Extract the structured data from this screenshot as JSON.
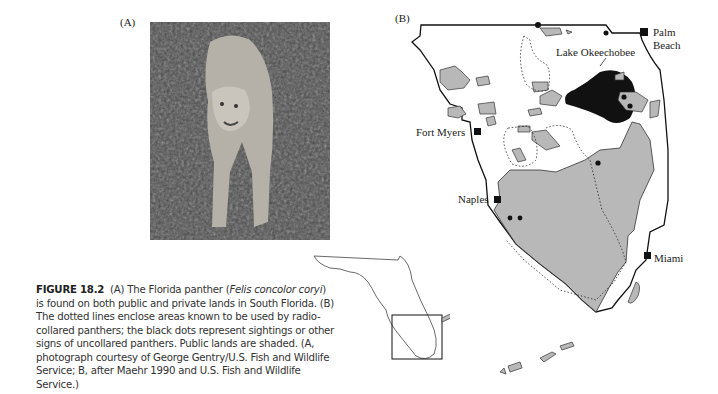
{
  "figure": {
    "number": "FIGURE 18.2",
    "panel_a_label": "(A)",
    "panel_b_label": "(B)",
    "caption": {
      "part1": "(A) The Florida panther (",
      "species": "Felis concolor coryi",
      "part2": ") is found on both public and private lands in South Florida. (B) The dotted lines enclose areas known to be used by radio-collared panthers; the black dots represent sightings or other signs of uncollared panthers. Public lands are shaded. (A, photograph courtesy of George Gentry/U.S. Fish and Wildlife Service; B, after Maehr 1990 and U.S. Fish and Wildlife Service.)"
    }
  },
  "photo": {
    "subject": "Florida panther",
    "tone": "grayscale"
  },
  "map": {
    "lake": "Lake Okeechobee",
    "cities": [
      {
        "name": "Palm",
        "name2": "Beach"
      },
      {
        "name": "Fort Myers"
      },
      {
        "name": "Naples"
      },
      {
        "name": "Miami"
      }
    ],
    "colors": {
      "public_land": "#b8b8b8",
      "lake": "#111111",
      "outline": "#111111"
    }
  }
}
